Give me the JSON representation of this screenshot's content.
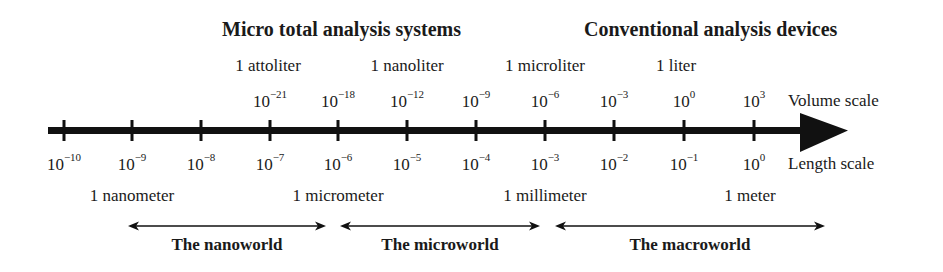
{
  "headings": {
    "micro": "Micro total analysis systems",
    "conventional": "Conventional analysis devices"
  },
  "volume_units": [
    {
      "label": "1 attoliter",
      "x": 268
    },
    {
      "label": "1 nanoliter",
      "x": 407
    },
    {
      "label": "1 microliter",
      "x": 545
    },
    {
      "label": "1 liter",
      "x": 676
    }
  ],
  "volume_scale": {
    "label": "Volume scale",
    "ticks": [
      {
        "base": "10",
        "exp": "−21",
        "x": 270
      },
      {
        "base": "10",
        "exp": "−18",
        "x": 338
      },
      {
        "base": "10",
        "exp": "−12",
        "x": 407
      },
      {
        "base": "10",
        "exp": "−9",
        "x": 476
      },
      {
        "base": "10",
        "exp": "−6",
        "x": 545
      },
      {
        "base": "10",
        "exp": "−3",
        "x": 614
      },
      {
        "base": "10",
        "exp": "0",
        "x": 684
      },
      {
        "base": "10",
        "exp": "3",
        "x": 754
      }
    ]
  },
  "length_scale": {
    "label": "Length scale",
    "ticks": [
      {
        "base": "10",
        "exp": "−10",
        "x": 64
      },
      {
        "base": "10",
        "exp": "−9",
        "x": 132
      },
      {
        "base": "10",
        "exp": "−8",
        "x": 201
      },
      {
        "base": "10",
        "exp": "−7",
        "x": 270
      },
      {
        "base": "10",
        "exp": "−6",
        "x": 338
      },
      {
        "base": "10",
        "exp": "−5",
        "x": 407
      },
      {
        "base": "10",
        "exp": "−4",
        "x": 476
      },
      {
        "base": "10",
        "exp": "−3",
        "x": 545
      },
      {
        "base": "10",
        "exp": "−2",
        "x": 614
      },
      {
        "base": "10",
        "exp": "−1",
        "x": 684
      },
      {
        "base": "10",
        "exp": "0",
        "x": 754
      }
    ]
  },
  "length_units": [
    {
      "label": "1 nanometer",
      "x": 132
    },
    {
      "label": "1 micrometer",
      "x": 338
    },
    {
      "label": "1 millimeter",
      "x": 545
    },
    {
      "label": "1 meter",
      "x": 750
    }
  ],
  "worlds": [
    {
      "label": "The nanoworld",
      "x1": 128,
      "x2": 326
    },
    {
      "label": "The microworld",
      "x1": 340,
      "x2": 540
    },
    {
      "label": "The macroworld",
      "x1": 555,
      "x2": 825
    }
  ],
  "colors": {
    "ink": "#111111",
    "background": "#ffffff"
  }
}
